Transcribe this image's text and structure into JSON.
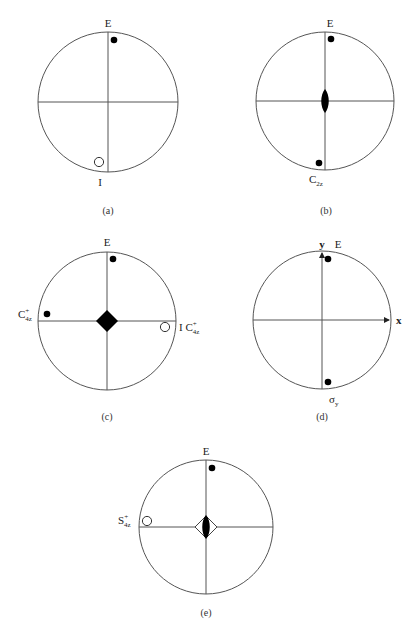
{
  "figure": {
    "panels": [
      {
        "id": "a",
        "caption": "(a)",
        "center": [
          108,
          102
        ],
        "radius": 70,
        "top_label": "E",
        "bottom_label": "I",
        "points": [
          {
            "label": "E",
            "kind": "filled",
            "pos": "upper, right of vertical axis"
          },
          {
            "label": "I",
            "kind": "open",
            "pos": "lower, left of vertical axis"
          }
        ],
        "center_symbol": "none"
      },
      {
        "id": "b",
        "caption": "(b)",
        "center": [
          325,
          101
        ],
        "radius": 69,
        "top_label": "E",
        "bottom_label": "C",
        "bottom_label_sub": "2z",
        "points": [
          {
            "label": "E",
            "kind": "filled",
            "pos": "upper, right of vertical axis"
          },
          {
            "label": "C2z",
            "kind": "filled",
            "pos": "lower, left of vertical axis"
          }
        ],
        "center_symbol": "two-fold axis (filled lens)"
      },
      {
        "id": "c",
        "caption": "(c)",
        "center": [
          107,
          321
        ],
        "radius": 69,
        "top_label": "E",
        "left_label": "C",
        "left_label_sub": "4z",
        "left_label_sup": "+",
        "right_label": "I C",
        "right_label_sub": "4z",
        "right_label_sup": "+",
        "points": [
          {
            "label": "E",
            "kind": "filled",
            "pos": "upper, right of vertical axis"
          },
          {
            "label": "C4z+",
            "kind": "filled",
            "pos": "left, above horizontal axis"
          },
          {
            "label": "I C4z+",
            "kind": "open",
            "pos": "right, below horizontal axis"
          }
        ],
        "center_symbol": "four-fold axis (filled square)"
      },
      {
        "id": "d",
        "caption": "(d)",
        "center": [
          322,
          320
        ],
        "radius": 69,
        "top_label": "E",
        "axis_y_label": "y",
        "axis_x_label": "x",
        "bottom_label": "σ",
        "bottom_label_sub": "y",
        "points": [
          {
            "label": "E",
            "kind": "filled",
            "pos": "upper, right of y axis"
          },
          {
            "label": "σy",
            "kind": "filled",
            "pos": "lower, right of y axis"
          }
        ],
        "center_symbol": "none"
      },
      {
        "id": "e",
        "caption": "(e)",
        "center": [
          206,
          527
        ],
        "radius": 67,
        "top_label": "E",
        "left_label": "S",
        "left_label_sub": "4z",
        "left_label_sup": "+",
        "points": [
          {
            "label": "E",
            "kind": "filled",
            "pos": "upper, right of vertical axis"
          },
          {
            "label": "S4z+",
            "kind": "open",
            "pos": "left, above horizontal axis"
          }
        ],
        "center_symbol": "four-fold rotoinversion (open square with filled lens)"
      }
    ]
  }
}
